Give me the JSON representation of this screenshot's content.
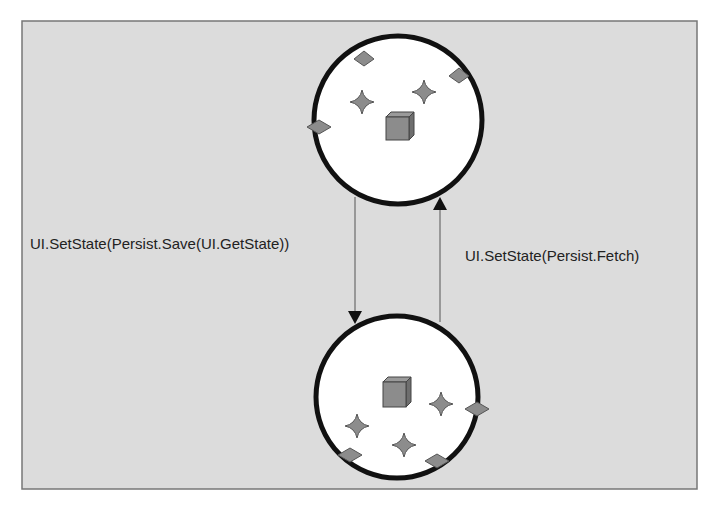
{
  "diagram": {
    "frame": {
      "x": 22,
      "y": 21,
      "width": 675,
      "height": 468,
      "fill": "#dcdcdc",
      "stroke": "#777777"
    },
    "states": [
      {
        "name": "top-state",
        "cx": 398,
        "cy": 120,
        "r": 84,
        "cube": {
          "x": 386,
          "y": 113
        },
        "stars": [
          {
            "x": 362,
            "y": 102
          },
          {
            "x": 424,
            "y": 92
          }
        ],
        "diamonds": [
          {
            "x": 364,
            "y": 59
          },
          {
            "x": 459,
            "y": 76
          },
          {
            "x": 319,
            "y": 127
          }
        ]
      },
      {
        "name": "bottom-state",
        "cx": 397,
        "cy": 397,
        "r": 81,
        "cube": {
          "x": 386,
          "y": 383
        },
        "stars": [
          {
            "x": 440,
            "y": 404
          },
          {
            "x": 357,
            "y": 426
          },
          {
            "x": 404,
            "y": 445
          }
        ],
        "diamonds": [
          {
            "x": 477,
            "y": 409
          },
          {
            "x": 350,
            "y": 455
          },
          {
            "x": 437,
            "y": 461
          }
        ]
      }
    ],
    "arrows": [
      {
        "name": "save-arrow",
        "label": "UI.SetState(Persist.Save(UI.GetState))",
        "x": 355,
        "y1": 197,
        "y2": 322,
        "direction": "down",
        "label_x": 30,
        "label_y": 249
      },
      {
        "name": "fetch-arrow",
        "label": "UI.SetState(Persist.Fetch)",
        "x": 440,
        "y1": 322,
        "y2": 200,
        "direction": "up",
        "label_x": 465,
        "label_y": 261
      }
    ],
    "colors": {
      "circle_fill": "#ffffff",
      "circle_stroke": "#111111",
      "shape_fill": "#8c8c8c",
      "shape_stroke": "#444444"
    }
  }
}
